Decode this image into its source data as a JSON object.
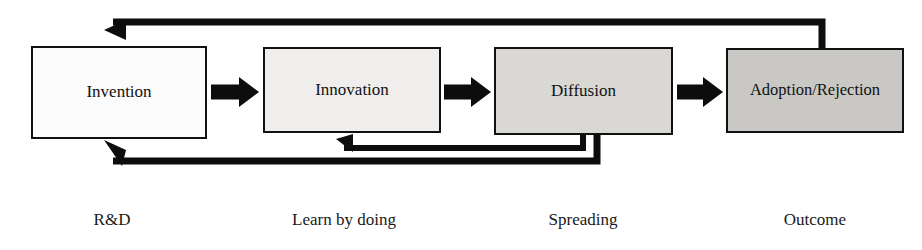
{
  "diagram": {
    "canvas": {
      "width": 922,
      "height": 250,
      "background": "#ffffff"
    },
    "stages": [
      {
        "id": "invention",
        "label": "Invention",
        "caption": "R&D",
        "fill": "#fbfbfb",
        "stroke": "#111111",
        "x": 32,
        "y": 47,
        "w": 174,
        "h": 91,
        "caption_x": 112,
        "caption_y": 221
      },
      {
        "id": "innovation",
        "label": "Innovation",
        "caption": "Learn by doing",
        "fill": "#efeeec",
        "stroke": "#111111",
        "x": 264,
        "y": 48,
        "w": 176,
        "h": 84,
        "caption_x": 344,
        "caption_y": 221
      },
      {
        "id": "diffusion",
        "label": "Diffusion",
        "caption": "Spreading",
        "fill": "#d9d8d4",
        "stroke": "#111111",
        "x": 495,
        "y": 48,
        "w": 177,
        "h": 86,
        "caption_x": 583,
        "caption_y": 221
      },
      {
        "id": "adoption-rejection",
        "label": "Adoption/Rejection",
        "caption": "Outcome",
        "fill": "#c9c8c4",
        "stroke": "#111111",
        "x": 727,
        "y": 49,
        "w": 176,
        "h": 83,
        "caption_x": 815,
        "caption_y": 221
      }
    ],
    "flow_arrows": [
      {
        "id": "invention-to-innovation",
        "from": "invention",
        "to": "innovation",
        "x": 211,
        "y": 92,
        "length": 48,
        "thickness": 15,
        "head": 20,
        "head_half": 15,
        "color": "#0d0d0d"
      },
      {
        "id": "innovation-to-diffusion",
        "from": "innovation",
        "to": "diffusion",
        "x": 444,
        "y": 92,
        "length": 47,
        "thickness": 15,
        "head": 20,
        "head_half": 15,
        "color": "#0d0d0d"
      },
      {
        "id": "diffusion-to-adoption",
        "from": "diffusion",
        "to": "adoption-rejection",
        "x": 677,
        "y": 92,
        "length": 46,
        "thickness": 15,
        "head": 20,
        "head_half": 15,
        "color": "#0d0d0d"
      }
    ],
    "feedback_loops": [
      {
        "id": "adoption-to-invention-top",
        "label": "Outcome feedback to Invention",
        "from": "adoption-rejection",
        "to": "invention",
        "side": "top",
        "path": "M 822 49 L 822 22 L 113 22",
        "stroke_width": 7,
        "head_points": "104,30 126,20 126,40",
        "color": "#0d0d0d"
      },
      {
        "id": "diffusion-to-innovation-bottom",
        "label": "Spreading feedback to Innovation",
        "from": "diffusion",
        "to": "innovation",
        "side": "bottom",
        "path": "M 583 134 L 583 148 L 344 148",
        "stroke_width": 6,
        "head_points": "336,139 353,134 353,152",
        "color": "#0d0d0d"
      },
      {
        "id": "diffusion-to-invention-bottom",
        "label": "Spreading feedback to Invention",
        "from": "diffusion",
        "to": "invention",
        "side": "bottom",
        "path": "M 597 134 L 597 161 L 113 161",
        "stroke_width": 7,
        "head_points": "104,140 126,150 122,166",
        "color": "#0d0d0d"
      }
    ]
  }
}
